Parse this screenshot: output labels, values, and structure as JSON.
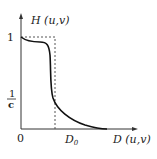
{
  "diagram": {
    "y_axis_label": "H (u,v)",
    "x_axis_label": "D (u,v)",
    "origin_label": "0",
    "y_tick_one": "1",
    "y_tick_fraction": {
      "numerator": "1",
      "denominator": "c"
    },
    "x_tick_cutoff": {
      "base": "D",
      "subscript": "0"
    },
    "colors": {
      "axis": "#333333",
      "curve": "#111111",
      "dashed": "#555555",
      "text": "#222222"
    }
  }
}
